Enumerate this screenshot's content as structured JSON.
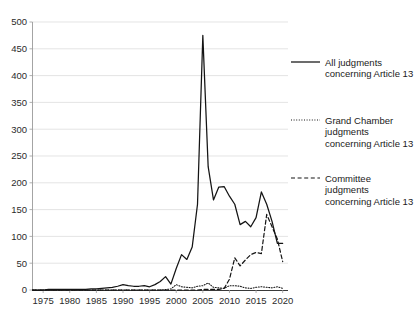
{
  "chart_data": {
    "type": "line",
    "title": "",
    "subtitle": "",
    "xlabel": "",
    "ylabel": "",
    "xlim": [
      1973,
      2021
    ],
    "ylim": [
      0,
      500
    ],
    "grid": true,
    "legend_position": "right",
    "x_ticks": [
      1975,
      1980,
      1985,
      1990,
      1995,
      2000,
      2005,
      2010,
      2015,
      2020
    ],
    "y_ticks": [
      0,
      50,
      100,
      150,
      200,
      250,
      300,
      350,
      400,
      450,
      500
    ],
    "x": [
      1973,
      1974,
      1975,
      1976,
      1977,
      1978,
      1979,
      1980,
      1981,
      1982,
      1983,
      1984,
      1985,
      1986,
      1987,
      1988,
      1989,
      1990,
      1991,
      1992,
      1993,
      1994,
      1995,
      1996,
      1997,
      1998,
      1999,
      2000,
      2001,
      2002,
      2003,
      2004,
      2005,
      2006,
      2007,
      2008,
      2009,
      2010,
      2011,
      2012,
      2013,
      2014,
      2015,
      2016,
      2017,
      2018,
      2019,
      2020
    ],
    "series": [
      {
        "name": "All judgments concerning Article 13",
        "style": "solid",
        "values": [
          0,
          0,
          0,
          1,
          1,
          1,
          1,
          1,
          1,
          1,
          1,
          2,
          2,
          3,
          4,
          5,
          7,
          10,
          8,
          7,
          7,
          8,
          6,
          10,
          16,
          25,
          11,
          40,
          66,
          57,
          80,
          160,
          475,
          230,
          168,
          192,
          193,
          175,
          160,
          122,
          128,
          118,
          135,
          183,
          160,
          128,
          87,
          87
        ]
      },
      {
        "name": "Grand Chamber judgments concerning Article 13",
        "style": "dotted",
        "values": [
          0,
          0,
          0,
          0,
          0,
          0,
          0,
          0,
          0,
          0,
          0,
          0,
          0,
          0,
          0,
          0,
          0,
          0,
          0,
          0,
          0,
          0,
          0,
          0,
          0,
          1,
          2,
          10,
          6,
          5,
          4,
          7,
          8,
          13,
          5,
          4,
          3,
          8,
          8,
          7,
          4,
          3,
          5,
          6,
          5,
          4,
          6,
          3
        ]
      },
      {
        "name": "Committee judgments concerning Article 13",
        "style": "dashed",
        "values": [
          0,
          0,
          0,
          0,
          0,
          0,
          0,
          0,
          0,
          0,
          0,
          0,
          0,
          0,
          0,
          0,
          0,
          0,
          0,
          0,
          0,
          0,
          0,
          0,
          0,
          0,
          0,
          0,
          0,
          0,
          0,
          0,
          1,
          1,
          1,
          1,
          3,
          20,
          60,
          45,
          56,
          66,
          70,
          68,
          141,
          118,
          95,
          53
        ]
      }
    ]
  },
  "axes": {
    "y_tick_labels": [
      "500",
      "450",
      "400",
      "350",
      "300",
      "250",
      "200",
      "150",
      "100",
      "50",
      "0"
    ],
    "x_tick_labels": [
      "1975",
      "1980",
      "1985",
      "1990",
      "1995",
      "2000",
      "2005",
      "2010",
      "2015",
      "2020"
    ]
  },
  "legend": {
    "items": [
      {
        "key": "all",
        "style": "solid",
        "line1": "All judgments",
        "line2": "concerning Article 13",
        "line3": ""
      },
      {
        "key": "grand-chamber",
        "style": "dotted",
        "line1": "Grand Chamber",
        "line2": "judgments",
        "line3": "concerning Article 13"
      },
      {
        "key": "committee",
        "style": "dashed",
        "line1": "Committee",
        "line2": "judgments",
        "line3": "concerning Article 13"
      }
    ]
  },
  "colors": {
    "line": "#141414",
    "grid": "#d9d9d9",
    "axis": "#9a9a9a",
    "text": "#1a1a1a",
    "background": "#ffffff"
  }
}
